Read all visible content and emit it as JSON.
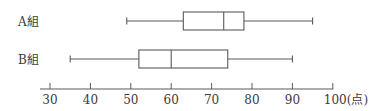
{
  "chart_data": {
    "type": "boxplot",
    "title": "",
    "xlabel": "(点)",
    "ylabel": "",
    "xlim": [
      30,
      100
    ],
    "xticks": [
      30,
      40,
      50,
      60,
      70,
      80,
      90,
      100
    ],
    "xtick_labels": [
      "30",
      "40",
      "50",
      "60",
      "70",
      "80",
      "90",
      "100(点)"
    ],
    "grid": false,
    "series": [
      {
        "name": "A組",
        "min": 49,
        "q1": 63,
        "median": 73,
        "q3": 78,
        "max": 95
      },
      {
        "name": "B組",
        "min": 35,
        "q1": 52,
        "median": 60,
        "q3": 74,
        "max": 90
      }
    ]
  },
  "colors": {
    "line": "#5a5a5a",
    "text": "#3a3a3a",
    "background": "#ffffff"
  }
}
